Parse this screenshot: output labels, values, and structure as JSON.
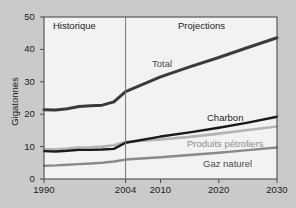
{
  "figure": {
    "background_color": "#cacaca",
    "plot_background_color": "#f2f2f2",
    "frame_color": "#4d4d4d"
  },
  "regions": {
    "historical_label": "Historique",
    "projection_label": "Projections",
    "divider_year": 2004
  },
  "series_labels": {
    "total": "Total",
    "coal": "Charbon",
    "oil": "Produits pétroliers",
    "gas": "Gaz naturel"
  },
  "colors": {
    "total": "#3a3a3a",
    "coal": "#1a1a1a",
    "oil": "#b4b4b4",
    "gas": "#8a8a8a",
    "divider": "#7a7a7a"
  },
  "chart_data": {
    "type": "line",
    "title": "",
    "xlabel": "",
    "ylabel": "Gigatonnes",
    "xlim": [
      1990,
      2030
    ],
    "ylim": [
      0,
      50
    ],
    "yticks": [
      0,
      10,
      20,
      30,
      40,
      50
    ],
    "ytick_labels": [
      "0",
      "10",
      "20",
      "30",
      "40",
      "50"
    ],
    "xticks": [
      1990,
      2004,
      2010,
      2020,
      2030
    ],
    "xtick_labels": [
      "1990",
      "2004",
      "2010",
      "2020",
      "2030"
    ],
    "grid": false,
    "legend_position": "inline-annotations",
    "annotations": [
      {
        "text": "Historique",
        "x": 1993.5,
        "y": 47.5
      },
      {
        "text": "Projections",
        "x": 2017.5,
        "y": 47.5
      },
      {
        "text": "Total",
        "x": 2010.5,
        "y": 34.0
      },
      {
        "text": "Charbon",
        "x": 2021.5,
        "y": 18.8
      },
      {
        "text": "Produits pétroliers",
        "x": 2024.0,
        "y": 13.6
      },
      {
        "text": "Gaz naturel",
        "x": 2024.5,
        "y": 9.0
      }
    ],
    "x": [
      1990,
      1992,
      1994,
      1996,
      1998,
      2000,
      2002,
      2004,
      2010,
      2015,
      2020,
      2025,
      2030
    ],
    "series": [
      {
        "name": "Total",
        "values": [
          21.4,
          21.3,
          21.7,
          22.4,
          22.6,
          22.8,
          23.8,
          27.0,
          31.5,
          34.6,
          37.5,
          40.6,
          43.6
        ]
      },
      {
        "name": "Charbon",
        "values": [
          8.6,
          8.5,
          8.7,
          9.0,
          9.0,
          9.1,
          9.3,
          11.2,
          13.1,
          14.4,
          15.8,
          17.4,
          19.2
        ]
      },
      {
        "name": "Produits pétroliers",
        "values": [
          9.2,
          9.2,
          9.4,
          9.7,
          9.8,
          10.0,
          10.4,
          11.4,
          12.2,
          13.0,
          14.0,
          15.1,
          16.2
        ]
      },
      {
        "name": "Gaz naturel",
        "values": [
          4.1,
          4.2,
          4.4,
          4.6,
          4.8,
          5.0,
          5.4,
          6.0,
          6.7,
          7.4,
          8.1,
          8.9,
          9.7
        ]
      }
    ]
  }
}
